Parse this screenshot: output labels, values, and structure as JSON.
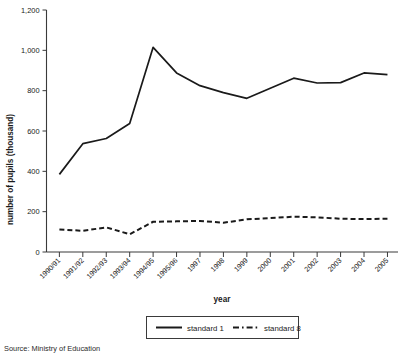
{
  "chart_data": {
    "type": "line",
    "title": "",
    "xlabel": "year",
    "ylabel": "number of pupils (thousand)",
    "categories": [
      "1990/91",
      "1991/92",
      "1992/93",
      "1993/94",
      "1994/95",
      "1995/96",
      "1997",
      "1998",
      "1999",
      "2000",
      "2001",
      "2002",
      "2003",
      "2004",
      "2005"
    ],
    "series": [
      {
        "name": "standard 1",
        "style": "solid",
        "values": [
          385,
          537,
          563,
          637,
          1015,
          888,
          825,
          790,
          762,
          812,
          862,
          838,
          840,
          888,
          880
        ]
      },
      {
        "name": "standard 8",
        "style": "dashed",
        "values": [
          112,
          105,
          122,
          88,
          150,
          152,
          154,
          145,
          162,
          168,
          175,
          172,
          165,
          163,
          165
        ]
      }
    ],
    "ylim": [
      0,
      1200
    ],
    "yticks": [
      0,
      200,
      400,
      600,
      800,
      1000,
      1200
    ],
    "ytick_labels": [
      "0",
      "200",
      "400",
      "600",
      "800",
      "1,000",
      "1,200"
    ],
    "grid": false,
    "legend_position": "bottom",
    "line_color": "#1a1a1a"
  },
  "axes": {
    "y_title": "number of pupils (thousand)",
    "x_title": "year"
  },
  "legend": {
    "entries": [
      {
        "label": "standard 1",
        "style": "solid"
      },
      {
        "label": "standard 8",
        "style": "dashed"
      }
    ]
  },
  "footer": {
    "source": "Source: Ministry of Education"
  }
}
